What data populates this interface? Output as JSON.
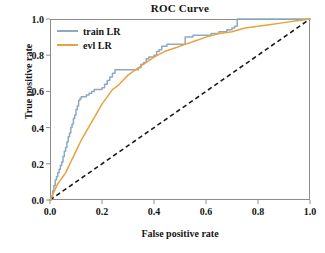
{
  "chart_data": {
    "type": "line",
    "title": "ROC Curve",
    "xlabel": "False positive rate",
    "ylabel": "True positive rate",
    "xlim": [
      0.0,
      1.0
    ],
    "ylim": [
      0.0,
      1.0
    ],
    "grid": false,
    "legend_position": "upper left",
    "xticks": [
      "0.0",
      "0.2",
      "0.4",
      "0.6",
      "0.8",
      "1.0"
    ],
    "xtick_values": [
      0.0,
      0.2,
      0.4,
      0.6,
      0.8,
      1.0
    ],
    "yticks": [
      "0.0",
      "0.2",
      "0.4",
      "0.6",
      "0.8",
      "1.0"
    ],
    "ytick_values": [
      0.0,
      0.2,
      0.4,
      0.6,
      0.8,
      1.0
    ],
    "series": [
      {
        "name": "train LR",
        "color": "#8da9c4",
        "style": "step",
        "x": [
          0.0,
          0.005,
          0.01,
          0.015,
          0.02,
          0.025,
          0.03,
          0.035,
          0.04,
          0.045,
          0.05,
          0.055,
          0.06,
          0.065,
          0.07,
          0.075,
          0.08,
          0.085,
          0.09,
          0.095,
          0.1,
          0.105,
          0.11,
          0.115,
          0.12,
          0.125,
          0.13,
          0.14,
          0.15,
          0.16,
          0.17,
          0.18,
          0.19,
          0.2,
          0.21,
          0.22,
          0.23,
          0.24,
          0.25,
          0.26,
          0.27,
          0.28,
          0.3,
          0.32,
          0.34,
          0.35,
          0.36,
          0.37,
          0.38,
          0.4,
          0.41,
          0.42,
          0.43,
          0.45,
          0.47,
          0.5,
          0.52,
          0.53,
          0.55,
          0.58,
          0.62,
          0.65,
          0.68,
          0.7,
          0.71,
          0.72,
          0.8,
          0.9,
          1.0
        ],
        "y": [
          0.0,
          0.02,
          0.05,
          0.08,
          0.11,
          0.13,
          0.15,
          0.17,
          0.19,
          0.21,
          0.24,
          0.27,
          0.29,
          0.32,
          0.35,
          0.37,
          0.4,
          0.42,
          0.45,
          0.47,
          0.5,
          0.52,
          0.55,
          0.56,
          0.57,
          0.57,
          0.57,
          0.58,
          0.59,
          0.6,
          0.61,
          0.61,
          0.61,
          0.62,
          0.64,
          0.66,
          0.68,
          0.7,
          0.72,
          0.72,
          0.72,
          0.72,
          0.72,
          0.72,
          0.73,
          0.75,
          0.76,
          0.78,
          0.79,
          0.8,
          0.82,
          0.83,
          0.85,
          0.86,
          0.86,
          0.86,
          0.9,
          0.9,
          0.91,
          0.91,
          0.92,
          0.93,
          0.94,
          0.95,
          0.96,
          1.0,
          1.0,
          1.0,
          1.0
        ]
      },
      {
        "name": "evl LR",
        "color": "#e8a33d",
        "style": "smooth",
        "x": [
          0.0,
          0.01,
          0.02,
          0.03,
          0.04,
          0.05,
          0.06,
          0.07,
          0.08,
          0.09,
          0.1,
          0.12,
          0.14,
          0.16,
          0.18,
          0.2,
          0.22,
          0.24,
          0.26,
          0.28,
          0.3,
          0.32,
          0.34,
          0.36,
          0.38,
          0.4,
          0.44,
          0.48,
          0.52,
          0.56,
          0.6,
          0.65,
          0.7,
          0.75,
          0.8,
          0.85,
          0.9,
          0.95,
          1.0
        ],
        "y": [
          0.0,
          0.03,
          0.06,
          0.09,
          0.11,
          0.13,
          0.15,
          0.18,
          0.21,
          0.24,
          0.27,
          0.33,
          0.38,
          0.43,
          0.48,
          0.53,
          0.57,
          0.61,
          0.63,
          0.66,
          0.69,
          0.71,
          0.73,
          0.75,
          0.77,
          0.79,
          0.82,
          0.84,
          0.86,
          0.88,
          0.9,
          0.92,
          0.93,
          0.95,
          0.96,
          0.97,
          0.98,
          0.99,
          1.0
        ]
      }
    ],
    "reference_line": {
      "name": "chance-diagonal",
      "color": "#1a1a1a",
      "style": "dashed",
      "x": [
        0.0,
        1.0
      ],
      "y": [
        0.0,
        1.0
      ]
    }
  },
  "legend": {
    "entries": [
      {
        "label": "train LR"
      },
      {
        "label": "evl LR"
      }
    ]
  }
}
